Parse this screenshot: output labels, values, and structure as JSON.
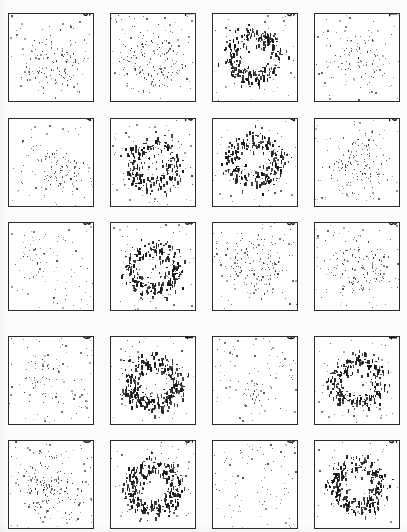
{
  "figure": {
    "kind": "scatterplot-grid",
    "rows": 5,
    "cols": 4,
    "panel_count": 20,
    "background_color": "#ffffff",
    "point_color": "#151515",
    "frame_color": "#2b2b2b",
    "number_rotation_deg": 90
  },
  "chart_data": {
    "type": "scatter",
    "title": "",
    "subtitle": "",
    "xlabel": "",
    "ylabel": "",
    "xlim": [
      0,
      1
    ],
    "ylim": [
      0,
      1
    ],
    "grid": false,
    "legend": null,
    "layout": {
      "rows": 5,
      "cols": 4,
      "panel_order_note": "Panel labels run bottom-to-top within each column; column 1 (left) holds 16-20, column 2 holds 11-15, column 3 holds 6-10, column 4 (right) holds 1-5.",
      "column_labels": [
        [
          "16",
          "17",
          "18",
          "19",
          "20"
        ],
        [
          "11",
          "12",
          "13",
          "14",
          "15"
        ],
        [
          "6",
          "7",
          "8",
          "9",
          "10"
        ],
        [
          "1",
          "2",
          "3",
          "4",
          "5"
        ]
      ]
    },
    "panels": [
      {
        "label": "1",
        "row": 0,
        "col": 3,
        "pattern": "diffuse-center-cluster",
        "cluster_points": 60,
        "noise_points": 70,
        "ring_radius": 0.2,
        "ring_width": 0.22,
        "center": [
          0.52,
          0.5
        ],
        "density": "low"
      },
      {
        "label": "2",
        "row": 1,
        "col": 3,
        "pattern": "loose-ring",
        "cluster_points": 90,
        "noise_points": 75,
        "ring_radius": 0.24,
        "ring_width": 0.2,
        "center": [
          0.5,
          0.52
        ],
        "density": "low-medium"
      },
      {
        "label": "3",
        "row": 2,
        "col": 3,
        "pattern": "loose-ring",
        "cluster_points": 100,
        "noise_points": 70,
        "ring_radius": 0.24,
        "ring_width": 0.18,
        "center": [
          0.52,
          0.5
        ],
        "density": "medium"
      },
      {
        "label": "4",
        "row": 3,
        "col": 3,
        "pattern": "dense-ring",
        "cluster_points": 230,
        "noise_points": 60,
        "ring_radius": 0.27,
        "ring_width": 0.12,
        "center": [
          0.5,
          0.5
        ],
        "density": "high"
      },
      {
        "label": "5",
        "row": 4,
        "col": 3,
        "pattern": "dense-ring",
        "cluster_points": 260,
        "noise_points": 55,
        "ring_radius": 0.27,
        "ring_width": 0.12,
        "center": [
          0.5,
          0.5
        ],
        "density": "high"
      },
      {
        "label": "6",
        "row": 0,
        "col": 2,
        "pattern": "dense-ring",
        "cluster_points": 240,
        "noise_points": 45,
        "ring_radius": 0.28,
        "ring_width": 0.12,
        "center": [
          0.48,
          0.48
        ],
        "density": "high"
      },
      {
        "label": "7",
        "row": 1,
        "col": 2,
        "pattern": "dense-ring",
        "cluster_points": 235,
        "noise_points": 55,
        "ring_radius": 0.27,
        "ring_width": 0.13,
        "center": [
          0.49,
          0.47
        ],
        "density": "high"
      },
      {
        "label": "8",
        "row": 2,
        "col": 2,
        "pattern": "partial-ring",
        "cluster_points": 110,
        "noise_points": 70,
        "ring_radius": 0.24,
        "ring_width": 0.18,
        "center": [
          0.5,
          0.46
        ],
        "density": "medium"
      },
      {
        "label": "9",
        "row": 3,
        "col": 2,
        "pattern": "sparse-noise",
        "cluster_points": 18,
        "noise_points": 85,
        "ring_radius": 0.1,
        "ring_width": 0.1,
        "center": [
          0.5,
          0.62
        ],
        "density": "very-low"
      },
      {
        "label": "10",
        "row": 4,
        "col": 2,
        "pattern": "sparse-noise",
        "cluster_points": 0,
        "noise_points": 90,
        "ring_radius": 0.0,
        "ring_width": 0.0,
        "center": [
          0.5,
          0.5
        ],
        "density": "very-low"
      },
      {
        "label": "11",
        "row": 0,
        "col": 1,
        "pattern": "loose-ring",
        "cluster_points": 110,
        "noise_points": 80,
        "ring_radius": 0.24,
        "ring_width": 0.18,
        "center": [
          0.5,
          0.55
        ],
        "density": "medium"
      },
      {
        "label": "12",
        "row": 1,
        "col": 1,
        "pattern": "dense-ring",
        "cluster_points": 200,
        "noise_points": 80,
        "ring_radius": 0.26,
        "ring_width": 0.14,
        "center": [
          0.5,
          0.52
        ],
        "density": "high"
      },
      {
        "label": "13",
        "row": 2,
        "col": 1,
        "pattern": "dense-ring",
        "cluster_points": 240,
        "noise_points": 65,
        "ring_radius": 0.27,
        "ring_width": 0.13,
        "center": [
          0.5,
          0.52
        ],
        "density": "high"
      },
      {
        "label": "14",
        "row": 3,
        "col": 1,
        "pattern": "very-dense-ring",
        "cluster_points": 300,
        "noise_points": 55,
        "ring_radius": 0.28,
        "ring_width": 0.12,
        "center": [
          0.5,
          0.52
        ],
        "density": "very-high"
      },
      {
        "label": "15",
        "row": 4,
        "col": 1,
        "pattern": "very-dense-ring",
        "cluster_points": 300,
        "noise_points": 55,
        "ring_radius": 0.28,
        "ring_width": 0.12,
        "center": [
          0.5,
          0.52
        ],
        "density": "very-high"
      },
      {
        "label": "16",
        "row": 0,
        "col": 0,
        "pattern": "diagonal-cluster",
        "cluster_points": 95,
        "noise_points": 55,
        "ring_radius": 0.22,
        "ring_width": 0.2,
        "center": [
          0.52,
          0.55
        ],
        "density": "medium"
      },
      {
        "label": "17",
        "row": 1,
        "col": 0,
        "pattern": "offset-cluster",
        "cluster_points": 70,
        "noise_points": 65,
        "ring_radius": 0.15,
        "ring_width": 0.18,
        "center": [
          0.62,
          0.58
        ],
        "density": "low-medium"
      },
      {
        "label": "18",
        "row": 2,
        "col": 0,
        "pattern": "sparse-noise",
        "cluster_points": 12,
        "noise_points": 80,
        "ring_radius": 0.12,
        "ring_width": 0.14,
        "center": [
          0.35,
          0.45
        ],
        "density": "very-low"
      },
      {
        "label": "19",
        "row": 3,
        "col": 0,
        "pattern": "sparse-noise",
        "cluster_points": 30,
        "noise_points": 85,
        "ring_radius": 0.16,
        "ring_width": 0.16,
        "center": [
          0.38,
          0.45
        ],
        "density": "low"
      },
      {
        "label": "20",
        "row": 4,
        "col": 0,
        "pattern": "diffuse-center-cluster",
        "cluster_points": 120,
        "noise_points": 90,
        "ring_radius": 0.2,
        "ring_width": 0.22,
        "center": [
          0.45,
          0.5
        ],
        "density": "medium"
      }
    ]
  },
  "geometry": {
    "panel_width": 86,
    "panel_height": 89,
    "col_x": [
      8,
      110,
      212,
      314
    ],
    "row_y": [
      13,
      118,
      222,
      336,
      440
    ]
  }
}
